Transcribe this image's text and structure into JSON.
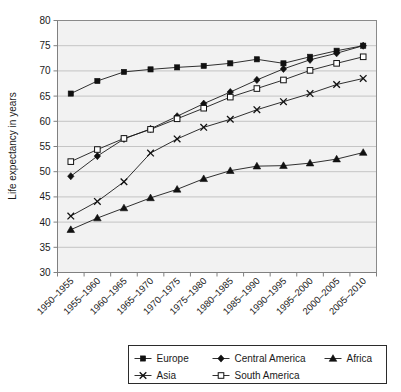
{
  "chart_data": {
    "type": "line",
    "title": "",
    "xlabel": "",
    "ylabel": "Life expectancy in years",
    "ylim": [
      30,
      80
    ],
    "ytick_step": 5,
    "yticks": [
      30,
      35,
      40,
      45,
      50,
      55,
      60,
      65,
      70,
      75,
      80
    ],
    "grid": true,
    "legend_position": "bottom",
    "categories": [
      "1950–1955",
      "1955–1960",
      "1960–1965",
      "1965–1970",
      "1970–1975",
      "1975–1980",
      "1980–1985",
      "1985–1990",
      "1990–1995",
      "1995–2000",
      "2000–2005",
      "2005–2010"
    ],
    "series": [
      {
        "name": "Europe",
        "marker": "square-filled",
        "values": [
          65.5,
          68.0,
          69.8,
          70.3,
          70.7,
          71.0,
          71.5,
          72.3,
          71.5,
          72.8,
          74.0,
          75.0
        ]
      },
      {
        "name": "Central America",
        "marker": "diamond-filled",
        "values": [
          49.1,
          53.1,
          56.5,
          58.5,
          61.0,
          63.5,
          65.8,
          68.2,
          70.4,
          72.2,
          73.5,
          75.0
        ]
      },
      {
        "name": "Africa",
        "marker": "triangle-filled",
        "values": [
          38.5,
          40.8,
          42.8,
          44.8,
          46.5,
          48.6,
          50.2,
          51.1,
          51.2,
          51.7,
          52.5,
          53.8
        ]
      },
      {
        "name": "Asia",
        "marker": "cross-x",
        "values": [
          41.2,
          44.1,
          48.0,
          53.7,
          56.5,
          58.8,
          60.4,
          62.3,
          63.9,
          65.5,
          67.3,
          68.5
        ]
      },
      {
        "name": "South America",
        "marker": "square-open",
        "values": [
          52.0,
          54.4,
          56.6,
          58.4,
          60.5,
          62.6,
          64.8,
          66.5,
          68.2,
          70.1,
          71.5,
          72.8
        ]
      }
    ]
  },
  "legend": {
    "items": [
      {
        "label": "Europe",
        "marker": "square-filled"
      },
      {
        "label": "Central America",
        "marker": "diamond-filled"
      },
      {
        "label": "Africa",
        "marker": "triangle-filled"
      },
      {
        "label": "Asia",
        "marker": "cross-x"
      },
      {
        "label": "South America",
        "marker": "square-open"
      }
    ]
  },
  "colors": {
    "ink": "#1a1a1a",
    "grid": "#b9b9b9",
    "plot_bg": "#f2f2f2",
    "frame": "#8a8a8a",
    "page_bg": "#ffffff"
  }
}
